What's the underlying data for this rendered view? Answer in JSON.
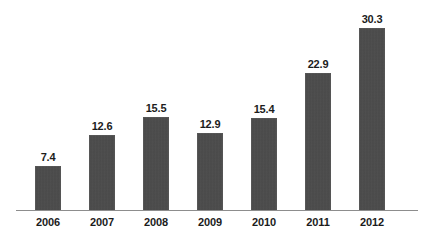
{
  "chart_data": {
    "type": "bar",
    "title": "",
    "subtitle": "",
    "xlabel": "",
    "ylabel": "",
    "categories": [
      "2006",
      "2007",
      "2008",
      "2009",
      "2010",
      "2011",
      "2012"
    ],
    "values": [
      7.4,
      12.6,
      15.5,
      12.9,
      15.4,
      22.9,
      30.3
    ],
    "value_labels": [
      "7.4",
      "12.6",
      "15.5",
      "12.9",
      "15.4",
      "22.9",
      "30.3"
    ],
    "series": [
      {
        "name": "",
        "values": [
          7.4,
          12.6,
          15.5,
          12.9,
          15.4,
          22.9,
          30.3
        ]
      }
    ],
    "ylim": [
      0,
      30.3
    ],
    "grid": false,
    "legend": false,
    "legend_position": "none",
    "bar_color": "#4a4a4a",
    "axis_color": "#8d8d8d",
    "label_color": "#1c1c1c",
    "background_color": "#ffffff",
    "data_labels_shown": true,
    "y_axis_shown": false,
    "x_axis_shown": true
  }
}
